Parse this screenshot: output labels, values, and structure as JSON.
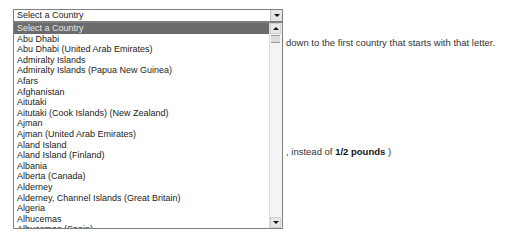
{
  "country_select": {
    "selected_value": "Select a Country",
    "options": [
      "Select a Country",
      "Abu Dhabi",
      "Abu Dhabi (United Arab Emirates)",
      "Admiralty Islands",
      "Admiralty Islands (Papua New Guinea)",
      "Afars",
      "Afghanistan",
      "Aitutaki",
      "Aitutaki (Cook Islands) (New Zealand)",
      "Ajman",
      "Ajman (United Arab Emirates)",
      "Aland Island",
      "Aland Island (Finland)",
      "Albania",
      "Alberta (Canada)",
      "Alderney",
      "Alderney, Channel Islands (Great Britain)",
      "Algeria",
      "Alhucemas",
      "Alhucemas (Spain)"
    ],
    "highlighted_index": 0
  },
  "page_text": {
    "line1": "down to the first country that starts with that letter.",
    "line2_prefix": ", instead of ",
    "line2_bold": "1/2 pounds",
    "line2_suffix": " )"
  },
  "icons": {
    "dropdown_arrow": "chevron-down-icon",
    "scroll_up": "scroll-up-icon",
    "scroll_down": "scroll-down-icon"
  }
}
